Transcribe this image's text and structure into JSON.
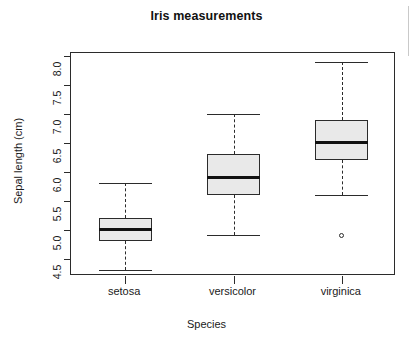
{
  "chart_data": {
    "type": "box",
    "title": "Iris measurements",
    "xlabel": "Species",
    "ylabel": "Sepal length (cm)",
    "categories": [
      "setosa",
      "versicolor",
      "virginica"
    ],
    "ylim": [
      4.2,
      8.05
    ],
    "yticks": [
      4.5,
      5.0,
      5.5,
      6.0,
      6.5,
      7.0,
      7.5,
      8.0
    ],
    "ytick_labels": [
      "4.5",
      "5.0",
      "5.5",
      "6.0",
      "6.5",
      "7.0",
      "7.5",
      "8.0"
    ],
    "grid": false,
    "legend": "none",
    "box_fill": "#e9e9e9",
    "box_stroke": "#2b2b2b",
    "boxes": [
      {
        "name": "setosa",
        "whisker_low": 4.3,
        "q1": 4.8,
        "median": 5.0,
        "q3": 5.2,
        "whisker_high": 5.8,
        "outliers": []
      },
      {
        "name": "versicolor",
        "whisker_low": 4.9,
        "q1": 5.6,
        "median": 5.9,
        "q3": 6.3,
        "whisker_high": 7.0,
        "outliers": []
      },
      {
        "name": "virginica",
        "whisker_low": 5.6,
        "q1": 6.2,
        "median": 6.5,
        "q3": 6.9,
        "whisker_high": 7.9,
        "outliers": [
          4.9
        ]
      }
    ]
  }
}
